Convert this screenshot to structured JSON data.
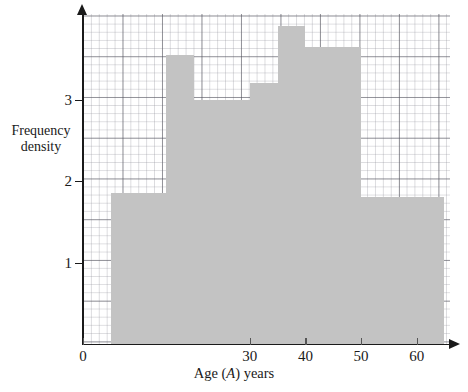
{
  "chart_data": {
    "type": "bar",
    "title": "",
    "xlabel": "Age (A) years",
    "ylabel": "Frequency density",
    "xlim": [
      0,
      66
    ],
    "ylim": [
      0,
      4.05
    ],
    "grid": "graph-paper (major every 10 years / 0.5 density, minor every 2 years / 0.1 density)",
    "legend": "none",
    "x_ticks": [
      0,
      30,
      40,
      50,
      60
    ],
    "x_tick_labels": [
      "0",
      "30",
      "40",
      "50",
      "60"
    ],
    "y_ticks": [
      1,
      2,
      3
    ],
    "y_tick_labels": [
      "1",
      "2",
      "3"
    ],
    "bin_edges": [
      5,
      15,
      20,
      30,
      35,
      40,
      50,
      65
    ],
    "categories": [
      "5-15",
      "15-20",
      "20-30",
      "30-35",
      "35-40",
      "40-50",
      "50-65"
    ],
    "values": [
      1.85,
      3.55,
      3.0,
      3.2,
      3.9,
      3.65,
      1.8
    ],
    "bars": [
      {
        "label": "5-15",
        "x0": 5,
        "x1": 15,
        "density": 1.85
      },
      {
        "label": "15-20",
        "x0": 15,
        "x1": 20,
        "density": 3.55
      },
      {
        "label": "20-30",
        "x0": 20,
        "x1": 30,
        "density": 3.0
      },
      {
        "label": "30-35",
        "x0": 30,
        "x1": 35,
        "density": 3.2
      },
      {
        "label": "35-40",
        "x0": 35,
        "x1": 40,
        "density": 3.9
      },
      {
        "label": "40-50",
        "x0": 40,
        "x1": 50,
        "density": 3.65
      },
      {
        "label": "50-65",
        "x0": 50,
        "x1": 65,
        "density": 1.8
      }
    ],
    "bar_color": "#c3c3c3"
  },
  "axes": {
    "y_title_line1": "Frequency",
    "y_title_line2": "density",
    "x_title_prefix": "Age (",
    "x_title_var": "A",
    "x_title_suffix": ") years"
  }
}
